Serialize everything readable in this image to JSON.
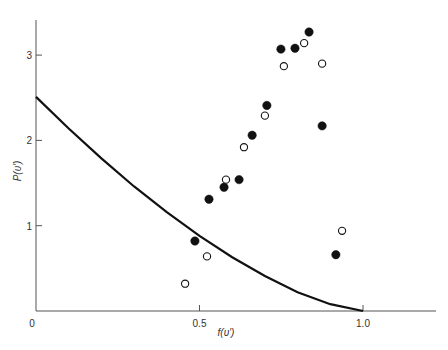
{
  "chart_data": {
    "type": "scatter",
    "title": "",
    "xlabel": "f(υ′)",
    "ylabel": "P(υ′)",
    "xlim": [
      0,
      1.23
    ],
    "ylim": [
      0,
      3.5
    ],
    "grid": false,
    "x_ticks": [
      {
        "value": 0,
        "label": "0"
      },
      {
        "value": 0.5,
        "label": "0.5"
      },
      {
        "value": 1.0,
        "label": "1.0"
      }
    ],
    "y_ticks": [
      {
        "value": 1,
        "label": "1"
      },
      {
        "value": 2,
        "label": "2"
      },
      {
        "value": 3,
        "label": "3"
      }
    ],
    "series": [
      {
        "name": "filled",
        "marker": "filled-circle",
        "points": [
          [
            0.486,
            0.82
          ],
          [
            0.529,
            1.31
          ],
          [
            0.575,
            1.45
          ],
          [
            0.621,
            1.54
          ],
          [
            0.661,
            2.06
          ],
          [
            0.706,
            2.41
          ],
          [
            0.749,
            3.07
          ],
          [
            0.792,
            3.08
          ],
          [
            0.835,
            3.27
          ],
          [
            0.875,
            2.17
          ],
          [
            0.917,
            0.66
          ]
        ]
      },
      {
        "name": "open",
        "marker": "open-circle",
        "points": [
          [
            0.456,
            0.32
          ],
          [
            0.523,
            0.64
          ],
          [
            0.581,
            1.54
          ],
          [
            0.636,
            1.92
          ],
          [
            0.7,
            2.29
          ],
          [
            0.758,
            2.87
          ],
          [
            0.82,
            3.14
          ],
          [
            0.875,
            2.9
          ],
          [
            0.936,
            0.94
          ]
        ]
      },
      {
        "name": "curve",
        "type": "line",
        "points": [
          [
            0.0,
            2.51
          ],
          [
            0.1,
            2.14
          ],
          [
            0.2,
            1.79
          ],
          [
            0.3,
            1.46
          ],
          [
            0.4,
            1.16
          ],
          [
            0.5,
            0.88
          ],
          [
            0.6,
            0.63
          ],
          [
            0.7,
            0.41
          ],
          [
            0.8,
            0.22
          ],
          [
            0.9,
            0.08
          ],
          [
            1.0,
            0.0
          ]
        ]
      }
    ]
  }
}
